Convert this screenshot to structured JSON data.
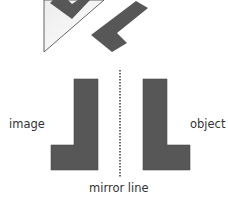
{
  "diagram": {
    "labels": {
      "image": "image",
      "object": "object",
      "mirror_line": "mirror line"
    },
    "colors": {
      "shape_fill": "#575757",
      "outline": "#555555",
      "triangle_fill": "#f6f6f6",
      "dotted_line": "#333333"
    },
    "shapes": [
      {
        "name": "rotated-l-upper-left",
        "points": "50,3 53,0 68,0 72,4 78,0 90,0 72,19"
      },
      {
        "name": "rotated-l-upper-right",
        "points": "136,1 148,8 117,33 127,43 112,52 91,35"
      },
      {
        "name": "image-l",
        "points": "74,79 98,79 98,170 51,170 51,145 74,145"
      },
      {
        "name": "object-l",
        "points": "143,79 167,79 167,145 190,145 190,170 143,170"
      }
    ],
    "triangle": {
      "points": "44,0 44,52 104,0"
    },
    "mirror": {
      "x": 120,
      "y1": 70,
      "y2": 178
    }
  }
}
